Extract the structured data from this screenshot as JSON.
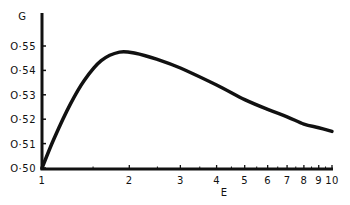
{
  "chart_data": {
    "type": "line",
    "title": "",
    "xlabel": "E",
    "ylabel": "G",
    "x_scale": "log",
    "xlim": [
      1,
      10
    ],
    "ylim": [
      0.5,
      0.555
    ],
    "grid": false,
    "legend": null,
    "x_tick_labels": [
      "1",
      "2",
      "3",
      "4",
      "5",
      "6",
      "7",
      "8",
      "9",
      "10"
    ],
    "y_tick_labels": [
      "O·50",
      "O·51",
      "O·52",
      "O·53",
      "O·54",
      "O·55"
    ],
    "series": [
      {
        "name": "G(E)",
        "x": [
          1.0,
          1.1,
          1.25,
          1.4,
          1.6,
          1.85,
          2.1,
          2.5,
          3.0,
          4.0,
          5.0,
          6.0,
          7.0,
          8.0,
          9.0,
          10.0
        ],
        "y": [
          0.5,
          0.512,
          0.526,
          0.536,
          0.544,
          0.5475,
          0.547,
          0.5445,
          0.541,
          0.534,
          0.528,
          0.524,
          0.521,
          0.518,
          0.5165,
          0.515
        ]
      }
    ]
  }
}
